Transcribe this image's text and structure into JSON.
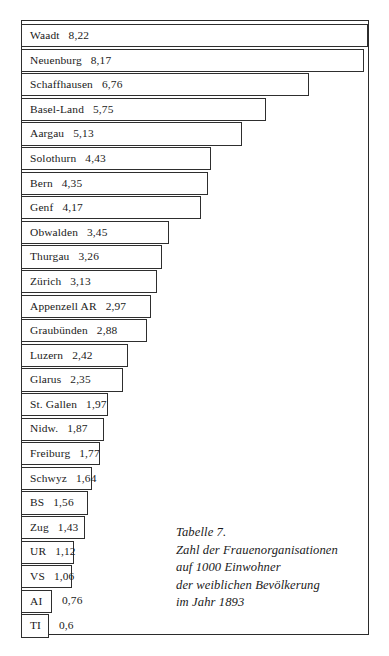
{
  "figure": {
    "caption_lines": [
      "Tabelle 7.",
      "Zahl der Frauenorganisationen",
      "auf 1000 Einwohner",
      "der weiblichen Bevölkerung",
      "im Jahr 1893"
    ]
  },
  "chart_data": {
    "type": "bar",
    "orientation": "horizontal",
    "title": "Tabelle 7.",
    "subtitle": "Zahl der Frauenorganisationen auf 1000 Einwohner der weiblichen Bevölkerung im Jahr 1893",
    "xlabel": "",
    "ylabel": "",
    "grid": false,
    "legend": false,
    "xlim": [
      0,
      8.22
    ],
    "decimal_separator": ",",
    "categories": [
      "Waadt",
      "Neuenburg",
      "Schaffhausen",
      "Basel-Land",
      "Aargau",
      "Solothurn",
      "Bern",
      "Genf",
      "Obwalden",
      "Thurgau",
      "Zürich",
      "Appenzell AR",
      "Graubünden",
      "Luzern",
      "Glarus",
      "St. Gallen",
      "Nidw.",
      "Freiburg",
      "Schwyz",
      "BS",
      "Zug",
      "UR",
      "VS",
      "AI",
      "TI"
    ],
    "values": [
      8.22,
      8.17,
      6.76,
      5.75,
      5.13,
      4.43,
      4.35,
      4.17,
      3.45,
      3.26,
      3.13,
      2.97,
      2.88,
      2.42,
      2.35,
      1.97,
      1.87,
      1.77,
      1.64,
      1.56,
      1.43,
      1.12,
      1.06,
      0.76,
      0.6
    ],
    "value_labels": [
      "8,22",
      "8,17",
      "6,76",
      "5,75",
      "5,13",
      "4,43",
      "4,35",
      "4,17",
      "3,45",
      "3,26",
      "3,13",
      "2,97",
      "2,88",
      "2,42",
      "2,35",
      "1,97",
      "1,87",
      "1,77",
      "1,64",
      "1,56",
      "1,43",
      "1,12",
      "1,06",
      "0,76",
      "0,6"
    ],
    "bars": [
      {
        "label": "Waadt",
        "value_label": "8,22",
        "value": 8.22,
        "bar_px": 347,
        "value_outside": false
      },
      {
        "label": "Neuenburg",
        "value_label": "8,17",
        "value": 8.17,
        "bar_px": 343,
        "value_outside": false
      },
      {
        "label": "Schaffhausen",
        "value_label": "6,76",
        "value": 6.76,
        "bar_px": 288,
        "value_outside": false
      },
      {
        "label": "Basel-Land",
        "value_label": "5,75",
        "value": 5.75,
        "bar_px": 245,
        "value_outside": false
      },
      {
        "label": "Aargau",
        "value_label": "5,13",
        "value": 5.13,
        "bar_px": 221,
        "value_outside": false
      },
      {
        "label": "Solothurn",
        "value_label": "4,43",
        "value": 4.43,
        "bar_px": 190,
        "value_outside": false
      },
      {
        "label": "Bern",
        "value_label": "4,35",
        "value": 4.35,
        "bar_px": 187,
        "value_outside": false
      },
      {
        "label": "Genf",
        "value_label": "4,17",
        "value": 4.17,
        "bar_px": 180,
        "value_outside": false
      },
      {
        "label": "Obwalden",
        "value_label": "3,45",
        "value": 3.45,
        "bar_px": 148,
        "value_outside": false
      },
      {
        "label": "Thurgau",
        "value_label": "3,26",
        "value": 3.26,
        "bar_px": 141,
        "value_outside": false
      },
      {
        "label": "Zürich",
        "value_label": "3,13",
        "value": 3.13,
        "bar_px": 136,
        "value_outside": false
      },
      {
        "label": "Appenzell AR",
        "value_label": "2,97",
        "value": 2.97,
        "bar_px": 130,
        "value_outside": false
      },
      {
        "label": "Graubünden",
        "value_label": "2,88",
        "value": 2.88,
        "bar_px": 126,
        "value_outside": false
      },
      {
        "label": "Luzern",
        "value_label": "2,42",
        "value": 2.42,
        "bar_px": 107,
        "value_outside": false
      },
      {
        "label": "Glarus",
        "value_label": "2,35",
        "value": 2.35,
        "bar_px": 102,
        "value_outside": false
      },
      {
        "label": "St. Gallen",
        "value_label": "1,97",
        "value": 1.97,
        "bar_px": 87,
        "value_outside": false
      },
      {
        "label": "Nidw.",
        "value_label": "1,87",
        "value": 1.87,
        "bar_px": 83,
        "value_outside": false
      },
      {
        "label": "Freiburg",
        "value_label": "1,77",
        "value": 1.77,
        "bar_px": 79,
        "value_outside": false
      },
      {
        "label": "Schwyz",
        "value_label": "1,64",
        "value": 1.64,
        "bar_px": 71,
        "value_outside": false
      },
      {
        "label": "BS",
        "value_label": "1,56",
        "value": 1.56,
        "bar_px": 67,
        "value_outside": false
      },
      {
        "label": "Zug",
        "value_label": "1,43",
        "value": 1.43,
        "bar_px": 64,
        "value_outside": false
      },
      {
        "label": "UR",
        "value_label": "1,12",
        "value": 1.12,
        "bar_px": 53,
        "value_outside": false
      },
      {
        "label": "VS",
        "value_label": "1,06",
        "value": 1.06,
        "bar_px": 51,
        "value_outside": false
      },
      {
        "label": "AI",
        "value_label": "0,76",
        "value": 0.76,
        "bar_px": 31,
        "value_outside": true
      },
      {
        "label": "TI",
        "value_label": "0,6",
        "value": 0.6,
        "bar_px": 28,
        "value_outside": true
      }
    ]
  }
}
